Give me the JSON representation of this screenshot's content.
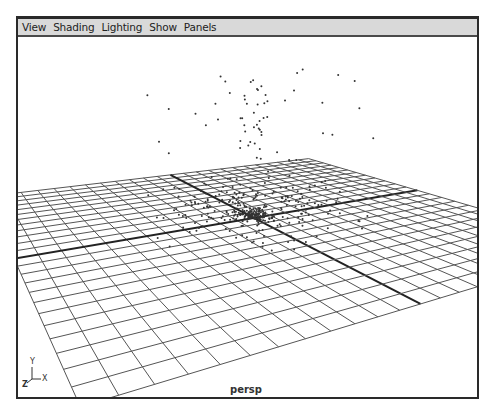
{
  "menubar": {
    "items": [
      {
        "label": "View"
      },
      {
        "label": "Shading"
      },
      {
        "label": "Lighting"
      },
      {
        "label": "Show"
      },
      {
        "label": "Panels"
      }
    ]
  },
  "viewport": {
    "camera_label": "persp",
    "axis_gizmo": {
      "y": "Y",
      "z": "Z",
      "x": "X"
    },
    "colors": {
      "grid": "#555555",
      "axis": "#222222",
      "points": "#333333",
      "menubar_bg": "#d9d9d9",
      "border": "#2a2a2a"
    }
  }
}
